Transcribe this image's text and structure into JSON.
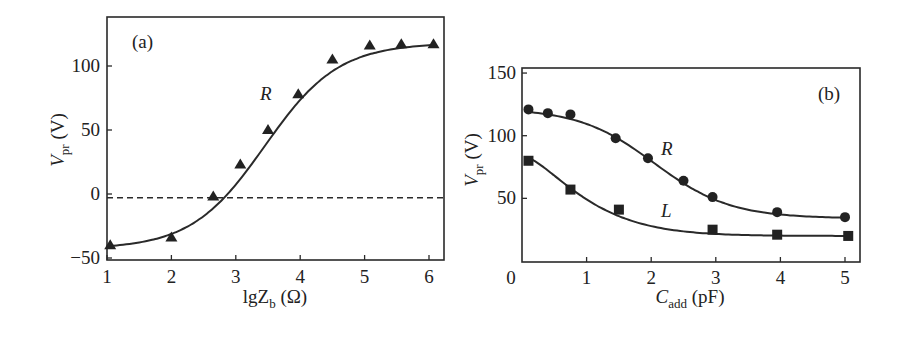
{
  "chart_data": [
    {
      "panel": "(a)",
      "type": "line",
      "title": "",
      "xlabel": "lgZ_b (Ω)",
      "ylabel": "V_pr (V)",
      "xlim": [
        1,
        6.2
      ],
      "ylim": [
        -52,
        138
      ],
      "xticks": [
        1,
        2,
        3,
        4,
        5,
        6
      ],
      "yticks": [
        -50,
        0,
        50,
        100
      ],
      "grid": false,
      "reference_line": {
        "y": -3,
        "style": "dashed"
      },
      "series": [
        {
          "name": "R",
          "marker": "triangle",
          "x": [
            1.05,
            2.0,
            2.65,
            3.07,
            3.5,
            3.97,
            4.5,
            5.08,
            5.57,
            6.07
          ],
          "y": [
            -40,
            -34,
            -2,
            23,
            50,
            78,
            105,
            116,
            117,
            117
          ]
        }
      ]
    },
    {
      "panel": "(b)",
      "type": "line",
      "title": "",
      "xlabel": "C_add (pF)",
      "ylabel": "V_pr (V)",
      "xlim": [
        0,
        5.2
      ],
      "ylim": [
        0,
        150
      ],
      "xticks": [
        0,
        1,
        2,
        3,
        4,
        5
      ],
      "yticks": [
        50,
        100,
        150
      ],
      "grid": false,
      "series": [
        {
          "name": "R",
          "marker": "circle",
          "x": [
            0.1,
            0.4,
            0.75,
            1.45,
            1.95,
            2.5,
            2.95,
            3.95,
            5.0
          ],
          "y": [
            121,
            118,
            117,
            98,
            82,
            64,
            51,
            39,
            35
          ]
        },
        {
          "name": "L",
          "marker": "square",
          "x": [
            0.1,
            0.75,
            1.5,
            2.95,
            3.95,
            5.05
          ],
          "y": [
            80,
            57,
            41,
            25,
            21,
            20
          ]
        }
      ]
    }
  ],
  "panels": {
    "a": {
      "tag": "(a)",
      "curve_label": "R",
      "xlabel_main": "lgZ",
      "xlabel_sub": "b",
      "xlabel_unit": " (Ω)",
      "ylabel_main": "V",
      "ylabel_sub": "pr",
      "ylabel_unit": " (V)",
      "xtick_labels": [
        "1",
        "2",
        "3",
        "4",
        "5",
        "6"
      ],
      "ytick_labels": [
        "−50",
        "0",
        "50",
        "100"
      ]
    },
    "b": {
      "tag": "(b)",
      "curve_label_R": "R",
      "curve_label_L": "L",
      "xlabel_main": "C",
      "xlabel_sub": "add",
      "xlabel_unit": " (pF)",
      "ylabel_main": "V",
      "ylabel_sub": "pr",
      "ylabel_unit": " (V)",
      "xtick_labels": [
        "0",
        "1",
        "2",
        "3",
        "4",
        "5"
      ],
      "ytick_labels": [
        "50",
        "100",
        "150"
      ]
    }
  }
}
